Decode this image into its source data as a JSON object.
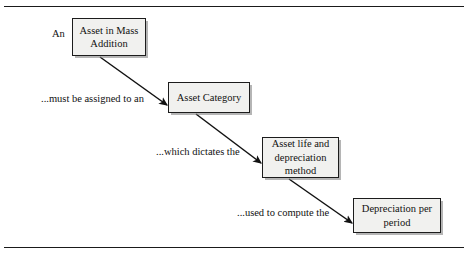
{
  "figure": {
    "background_color": "#ffffff",
    "rule_color": "#1a1a1a",
    "node_fill_color": "#f1f1ef",
    "node_border_color": "#1c1c1c",
    "arrow_color": "#111111"
  },
  "nodes": [
    {
      "id": "asset-in-mass-addition",
      "label": "Asset in Mass Addition"
    },
    {
      "id": "asset-category",
      "label": "Asset Category"
    },
    {
      "id": "asset-life-depreciation",
      "label": "Asset life and depreciation method"
    },
    {
      "id": "depreciation-per-period",
      "label": "Depreciation per period"
    }
  ],
  "captions": {
    "an": "An",
    "must_be_assigned": "...must be assigned to an",
    "which_dictates": "...which dictates the",
    "used_to_compute": "...used to compute the"
  },
  "edges": [
    {
      "id": "edge-1",
      "from": "asset-in-mass-addition",
      "to": "asset-category",
      "label": "...must be assigned to an"
    },
    {
      "id": "edge-2",
      "from": "asset-category",
      "to": "asset-life-depreciation",
      "label": "...which dictates the"
    },
    {
      "id": "edge-3",
      "from": "asset-life-depreciation",
      "to": "depreciation-per-period",
      "label": "...used to compute the"
    }
  ]
}
